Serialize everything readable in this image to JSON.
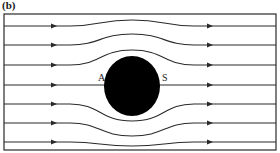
{
  "figure": {
    "panel_label": "(b)",
    "labels": {
      "front_point": "A",
      "rear_point": "S"
    },
    "colors": {
      "line": "#2a2a2a",
      "cylinder": "#000000",
      "background": "#ffffff"
    },
    "frame": {
      "x": 4,
      "y": 14,
      "width": 272,
      "height": 136
    },
    "cylinder": {
      "cx": 132,
      "cy": 86,
      "rx": 28,
      "ry": 30
    },
    "streamlines": [
      {
        "id": 1,
        "y_far": 26,
        "y_mid": 20
      },
      {
        "id": 2,
        "y_far": 45,
        "y_mid": 34
      },
      {
        "id": 3,
        "y_far": 65,
        "y_mid": 50
      },
      {
        "id": 4,
        "y_far": 85,
        "y_mid": 85,
        "stagnation": true
      },
      {
        "id": 5,
        "y_far": 104,
        "y_mid": 121
      },
      {
        "id": 6,
        "y_far": 123,
        "y_mid": 136
      },
      {
        "id": 7,
        "y_far": 142,
        "y_mid": 146
      }
    ],
    "arrow_positions_x": [
      54,
      210
    ]
  }
}
